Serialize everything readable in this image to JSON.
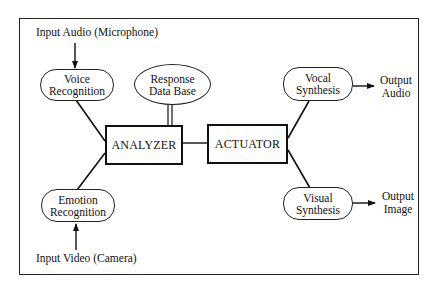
{
  "diagram": {
    "inputs": {
      "audio": "Input Audio (Microphone)",
      "video": "Input Video (Camera)"
    },
    "nodes": {
      "voice_recognition": [
        "Voice",
        "Recognition"
      ],
      "emotion_recognition": [
        "Emotion",
        "Recognition"
      ],
      "response_database": [
        "Response",
        "Data Base"
      ],
      "analyzer": "ANALYZER",
      "actuator": "ACTUATOR",
      "vocal_synthesis": [
        "Vocal",
        "Synthesis"
      ],
      "visual_synthesis": [
        "Visual",
        "Synthesis"
      ]
    },
    "outputs": {
      "audio": [
        "Output",
        "Audio"
      ],
      "image": [
        "Output",
        "Image"
      ]
    },
    "edges": [
      {
        "from": "Input Audio (Microphone)",
        "to": "Voice Recognition",
        "arrow": true
      },
      {
        "from": "Input Video (Camera)",
        "to": "Emotion Recognition",
        "arrow": true
      },
      {
        "from": "Voice Recognition",
        "to": "ANALYZER",
        "arrow": false
      },
      {
        "from": "Emotion Recognition",
        "to": "ANALYZER",
        "arrow": false
      },
      {
        "from": "Response Data Base",
        "to": "ANALYZER",
        "arrow": false,
        "style": "double"
      },
      {
        "from": "ANALYZER",
        "to": "ACTUATOR",
        "arrow": false
      },
      {
        "from": "ACTUATOR",
        "to": "Vocal Synthesis",
        "arrow": false
      },
      {
        "from": "ACTUATOR",
        "to": "Visual Synthesis",
        "arrow": false
      },
      {
        "from": "Vocal Synthesis",
        "to": "Output Audio",
        "arrow": true
      },
      {
        "from": "Visual Synthesis",
        "to": "Output Image",
        "arrow": true
      }
    ]
  }
}
